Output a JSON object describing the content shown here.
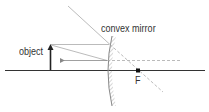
{
  "labels": {
    "mirror": "convex mirror",
    "object": "object",
    "focal_point": "F"
  },
  "colors": {
    "axis": "#333333",
    "ray": "#999999",
    "object_arrow": "#222222",
    "mirror": "#888888"
  }
}
